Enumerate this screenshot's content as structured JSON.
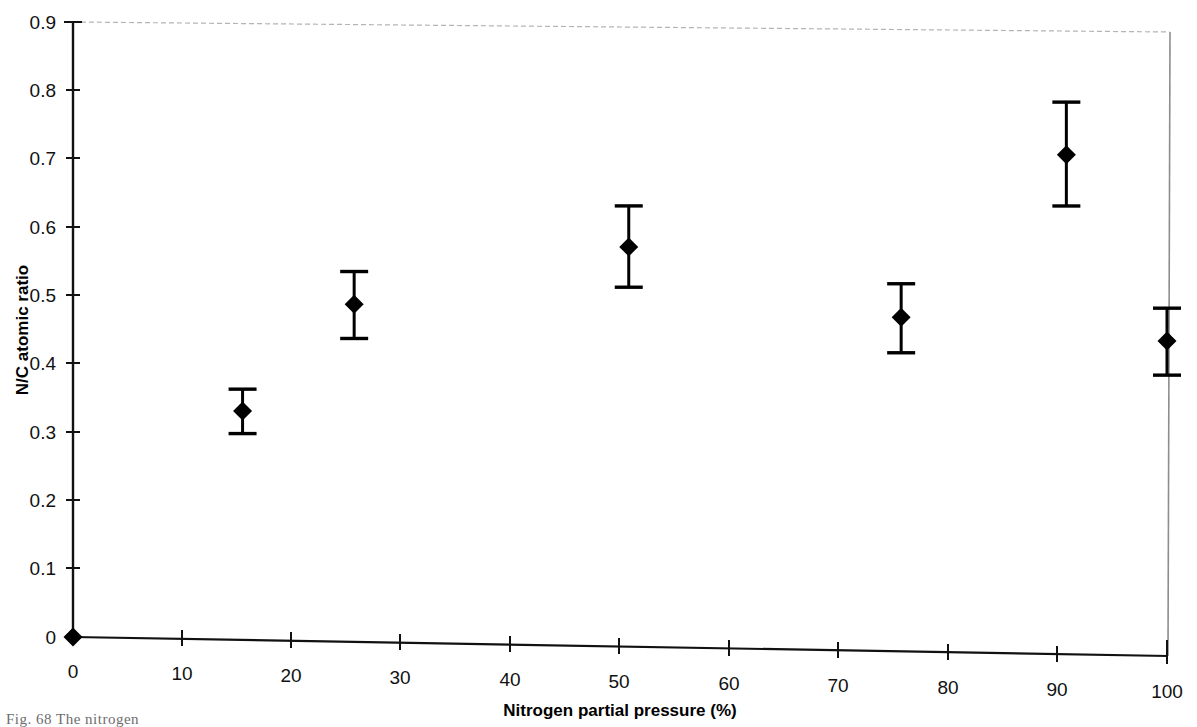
{
  "figure": {
    "caption": "Fig. 68   The nitrogen",
    "background_color": "#ffffff",
    "ink_color": "#000000"
  },
  "chart_data": {
    "type": "scatter",
    "title": "",
    "xlabel": "Nitrogen partial pressure (%)",
    "ylabel": "N/C atomic ratio",
    "xlim": [
      0,
      100
    ],
    "ylim": [
      0,
      0.9
    ],
    "grid": false,
    "legend": null,
    "xticks": [
      0,
      10,
      20,
      30,
      40,
      50,
      60,
      70,
      80,
      90,
      100
    ],
    "xtick_labels": [
      "0",
      "10",
      "20",
      "30",
      "40",
      "50",
      "60",
      "70",
      "80",
      "90",
      "100"
    ],
    "yticks": [
      0,
      0.1,
      0.2,
      0.3,
      0.4,
      0.5,
      0.6,
      0.7,
      0.8,
      0.9
    ],
    "ytick_labels": [
      "0",
      "0.1",
      "0.2",
      "0.3",
      "0.4",
      "0.5",
      "0.6",
      "0.7",
      "0.8",
      "0.9"
    ],
    "marker": "filled-diamond",
    "error_bars": "vertical-with-caps",
    "series": [
      {
        "name": "N/C atomic ratio",
        "points": [
          {
            "x": 0.0,
            "y": 0.0,
            "yerr_low": 0.0,
            "yerr_high": 0.0,
            "has_error_bar": false
          },
          {
            "x": 15.5,
            "y": 0.335,
            "yerr_low": 0.302,
            "yerr_high": 0.367,
            "has_error_bar": true
          },
          {
            "x": 25.7,
            "y": 0.494,
            "yerr_low": 0.444,
            "yerr_high": 0.542,
            "has_error_bar": true
          },
          {
            "x": 50.8,
            "y": 0.585,
            "yerr_low": 0.526,
            "yerr_high": 0.645,
            "has_error_bar": true
          },
          {
            "x": 75.7,
            "y": 0.489,
            "yerr_low": 0.437,
            "yerr_high": 0.538,
            "has_error_bar": true
          },
          {
            "x": 90.8,
            "y": 0.731,
            "yerr_low": 0.656,
            "yerr_high": 0.808,
            "has_error_bar": true
          },
          {
            "x": 100.0,
            "y": 0.461,
            "yerr_low": 0.411,
            "yerr_high": 0.509,
            "has_error_bar": true
          }
        ]
      }
    ]
  }
}
